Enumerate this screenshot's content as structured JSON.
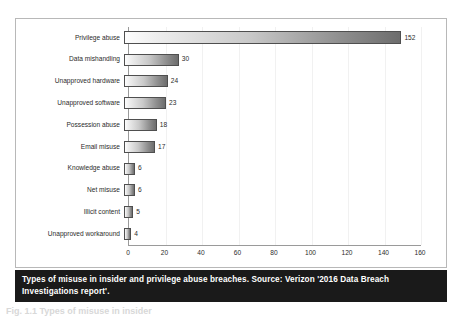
{
  "chart_data": {
    "type": "bar",
    "orientation": "horizontal",
    "title": "",
    "xlabel": "",
    "ylabel": "",
    "categories": [
      "Privilege abuse",
      "Data mishandling",
      "Unapproved hardware",
      "Unapproved software",
      "Possession abuse",
      "Email misuse",
      "Knowledge abuse",
      "Net misuse",
      "Illicit content",
      "Unapproved workaround"
    ],
    "values": [
      152,
      30,
      24,
      23,
      18,
      17,
      6,
      6,
      5,
      4
    ],
    "value_labels": [
      "152",
      "30",
      "24",
      "23",
      "18",
      "17",
      "6",
      "6",
      "5",
      "4"
    ],
    "xlim": [
      0,
      160
    ],
    "xticks": [
      0,
      20,
      40,
      60,
      80,
      100,
      120,
      140,
      160
    ],
    "xtick_labels": [
      "0",
      "20",
      "40",
      "60",
      "80",
      "100",
      "120",
      "140",
      "160"
    ],
    "grid": true,
    "grid_axis": "x",
    "legend": false,
    "bar_gradient_from": "#fdfdfd",
    "bar_gradient_to": "#6d6d6d",
    "bar_border_color": "#4f4f4f",
    "axis_color": "#9a9a9a",
    "gridline_color": "#f1f1f1",
    "text_color": "#2b2b2b"
  },
  "caption": {
    "text": "Types of misuse in insider and privilege abuse breaches. Source: Verizon '2016 Data Breach Investigations report'.",
    "background": "#1a1a1a",
    "color": "#ffffff"
  },
  "page_footer": {
    "text": "Fig. 1.1  Types of misuse in insider"
  },
  "frame": {
    "border_color": "#b8b8b8",
    "background": "#ffffff"
  }
}
